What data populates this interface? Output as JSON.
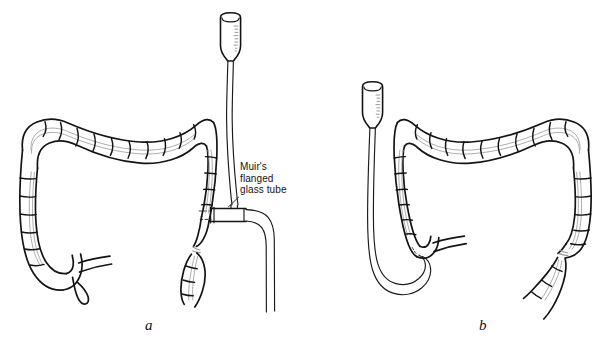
{
  "figure": {
    "background_color": "#ffffff",
    "ink_color": "#141414",
    "taenia_color": "#a9a9a9",
    "width": 611,
    "height": 348,
    "panels": [
      {
        "id": "a",
        "caption": "a",
        "description": "Large bowel with Muir's flanged glass tube inserted into the rectum, funnel reservoir raised above and drainage tube running down",
        "parts": [
          "funnel-reservoir",
          "inflow-tube",
          "muirs-flanged-glass-tube",
          "drainage-tube",
          "transverse-colon",
          "ascending-colon",
          "descending-colon",
          "caecum",
          "appendix",
          "ileum",
          "sigmoid-colon",
          "rectum",
          "anastomosis-stricture"
        ]
      },
      {
        "id": "b",
        "caption": "b",
        "description": "Mirrored large bowel with catheter passed around the sigmoid loop into the caecum, funnel reservoir at left",
        "parts": [
          "funnel-reservoir",
          "inflow-tube",
          "catheter-loop",
          "transverse-colon",
          "ascending-colon",
          "descending-colon",
          "caecum",
          "ileum",
          "sigmoid-colon",
          "rectum",
          "anastomosis-stricture"
        ]
      }
    ]
  },
  "callouts": [
    {
      "id": "muirs-flanged-glass-tube",
      "lines": [
        "Muir's",
        "flanged",
        "glass tube"
      ],
      "line1": "Muir's",
      "line2": "flanged",
      "line3": "glass tube",
      "target": "flange-junction"
    }
  ],
  "captions": {
    "panel_a": "a",
    "panel_b": "b"
  }
}
